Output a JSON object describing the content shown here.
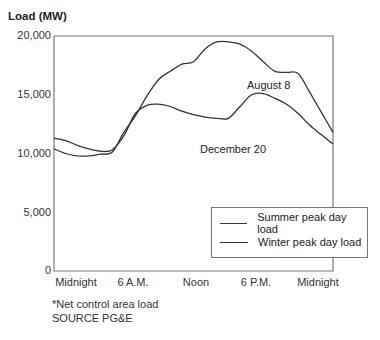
{
  "chart_data": {
    "type": "line",
    "title": "",
    "ylabel": "Load (MW)",
    "xlabel": "",
    "ylim": [
      0,
      20000
    ],
    "xlim_hours": [
      0,
      24
    ],
    "yticks": [
      "0",
      "5,000",
      "10,000",
      "15,000",
      "20,000"
    ],
    "xticks": [
      "Midnight",
      "6 A.M.",
      "Noon",
      "6 P.M.",
      "Midnight"
    ],
    "grid": false,
    "legend_position": "lower right",
    "series": [
      {
        "name": "Summer peak day load",
        "annotation": "August 8",
        "x_hours": [
          0,
          1,
          2,
          3,
          4,
          5,
          6,
          7,
          8,
          9,
          10,
          11,
          12,
          13,
          14,
          15,
          16,
          17,
          18,
          19,
          20,
          21,
          22,
          23,
          24
        ],
        "values": [
          10400,
          10000,
          9800,
          9800,
          9950,
          10100,
          11800,
          13200,
          14900,
          16300,
          17000,
          17600,
          17800,
          18900,
          19500,
          19500,
          19300,
          18700,
          17800,
          17000,
          16900,
          16800,
          15200,
          13500,
          11800
        ]
      },
      {
        "name": "Winter peak day load",
        "annotation": "December 20",
        "x_hours": [
          0,
          1,
          2,
          3,
          4,
          5,
          6,
          7,
          8,
          9,
          10,
          11,
          12,
          13,
          14,
          15,
          16,
          17,
          18,
          19,
          20,
          21,
          22,
          23,
          24
        ],
        "values": [
          11300,
          11100,
          10700,
          10400,
          10200,
          10300,
          11500,
          13400,
          14100,
          14200,
          14000,
          13600,
          13300,
          13100,
          13000,
          13000,
          14000,
          15000,
          15100,
          14700,
          14200,
          13400,
          12400,
          11600,
          10800
        ]
      }
    ]
  },
  "axis": {
    "title": "Load (MW)",
    "yticks": [
      "20,000",
      "15,000",
      "10,000",
      "5,000",
      "0"
    ],
    "xticks": [
      "Midnight",
      "6 A.M.",
      "Noon",
      "6 P.M.",
      "Midnight"
    ]
  },
  "annotations": {
    "summer": "August 8",
    "winter": "December 20"
  },
  "legend": {
    "summer": "Summer peak day load",
    "winter": "Winter peak day load"
  },
  "notes": {
    "footnote": "*Net control area load",
    "source": "SOURCE PG&E"
  },
  "colors": {
    "line": "#333333",
    "axis": "#666666"
  }
}
